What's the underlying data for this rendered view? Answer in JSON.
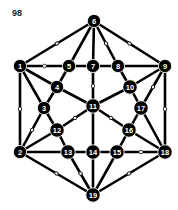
{
  "figure": {
    "label": "98",
    "colors": {
      "edge": "#000000",
      "node_fill": "#000000",
      "node_text": "#ffffff",
      "marker": "#ffffff"
    }
  },
  "graph": {
    "nodes": [
      {
        "id": "1",
        "x": 20,
        "y": 66
      },
      {
        "id": "2",
        "x": 20,
        "y": 152
      },
      {
        "id": "3",
        "x": 44,
        "y": 108
      },
      {
        "id": "4",
        "x": 57,
        "y": 87
      },
      {
        "id": "5",
        "x": 69,
        "y": 66
      },
      {
        "id": "6",
        "x": 94,
        "y": 21
      },
      {
        "id": "7",
        "x": 93,
        "y": 66
      },
      {
        "id": "8",
        "x": 118,
        "y": 66
      },
      {
        "id": "9",
        "x": 165,
        "y": 66
      },
      {
        "id": "10",
        "x": 130,
        "y": 87
      },
      {
        "id": "11",
        "x": 93,
        "y": 106
      },
      {
        "id": "12",
        "x": 57,
        "y": 130
      },
      {
        "id": "13",
        "x": 68,
        "y": 152
      },
      {
        "id": "14",
        "x": 93,
        "y": 152
      },
      {
        "id": "15",
        "x": 117,
        "y": 152
      },
      {
        "id": "16",
        "x": 129,
        "y": 130
      },
      {
        "id": "17",
        "x": 141,
        "y": 108
      },
      {
        "id": "18",
        "x": 165,
        "y": 152
      },
      {
        "id": "19",
        "x": 93,
        "y": 195
      }
    ],
    "edges": [
      {
        "from": "6",
        "to": "1",
        "marked": true
      },
      {
        "from": "6",
        "to": "5",
        "marked": false
      },
      {
        "from": "6",
        "to": "7",
        "marked": false
      },
      {
        "from": "6",
        "to": "8",
        "marked": true
      },
      {
        "from": "6",
        "to": "9",
        "marked": true
      },
      {
        "from": "1",
        "to": "5",
        "marked": true
      },
      {
        "from": "5",
        "to": "7",
        "marked": false
      },
      {
        "from": "7",
        "to": "8",
        "marked": false
      },
      {
        "from": "8",
        "to": "9",
        "marked": false
      },
      {
        "from": "1",
        "to": "4",
        "marked": false
      },
      {
        "from": "1",
        "to": "3",
        "marked": false
      },
      {
        "from": "1",
        "to": "2",
        "marked": true
      },
      {
        "from": "5",
        "to": "4",
        "marked": false
      },
      {
        "from": "4",
        "to": "3",
        "marked": false
      },
      {
        "from": "4",
        "to": "11",
        "marked": false
      },
      {
        "from": "7",
        "to": "11",
        "marked": true
      },
      {
        "from": "8",
        "to": "10",
        "marked": false
      },
      {
        "from": "9",
        "to": "10",
        "marked": false
      },
      {
        "from": "9",
        "to": "17",
        "marked": true
      },
      {
        "from": "9",
        "to": "18",
        "marked": true
      },
      {
        "from": "10",
        "to": "11",
        "marked": false
      },
      {
        "from": "10",
        "to": "17",
        "marked": false
      },
      {
        "from": "3",
        "to": "12",
        "marked": false
      },
      {
        "from": "3",
        "to": "2",
        "marked": true
      },
      {
        "from": "11",
        "to": "12",
        "marked": true
      },
      {
        "from": "11",
        "to": "16",
        "marked": true
      },
      {
        "from": "11",
        "to": "14",
        "marked": false
      },
      {
        "from": "17",
        "to": "16",
        "marked": false
      },
      {
        "from": "17",
        "to": "18",
        "marked": false
      },
      {
        "from": "12",
        "to": "2",
        "marked": false
      },
      {
        "from": "12",
        "to": "13",
        "marked": false
      },
      {
        "from": "16",
        "to": "15",
        "marked": false
      },
      {
        "from": "16",
        "to": "18",
        "marked": false
      },
      {
        "from": "2",
        "to": "13",
        "marked": false
      },
      {
        "from": "13",
        "to": "14",
        "marked": false
      },
      {
        "from": "14",
        "to": "15",
        "marked": false
      },
      {
        "from": "15",
        "to": "18",
        "marked": true
      },
      {
        "from": "2",
        "to": "19",
        "marked": true
      },
      {
        "from": "13",
        "to": "19",
        "marked": true
      },
      {
        "from": "14",
        "to": "19",
        "marked": false
      },
      {
        "from": "15",
        "to": "19",
        "marked": false
      },
      {
        "from": "18",
        "to": "19",
        "marked": true
      }
    ]
  }
}
